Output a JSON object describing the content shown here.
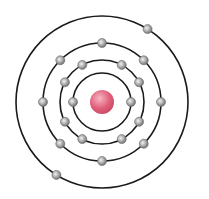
{
  "diagram": {
    "type": "bohr-atom-model",
    "element_electron_configuration": [
      2,
      8,
      8,
      2
    ],
    "center": [
      102,
      102
    ],
    "nucleus": {
      "radius": 12,
      "color": "#e0607a",
      "highlight": "#f7b6c4"
    },
    "electron": {
      "radius": 4.5,
      "color": "#9a9a9a",
      "highlight": "#f2f2f2",
      "stroke": "#6a6a6a"
    },
    "orbit_color": "#1a1a1a",
    "shells": [
      {
        "radius": 29,
        "electron_angles_deg": [
          180,
          0
        ]
      },
      {
        "radius": 42,
        "electron_angles_deg": [
          -118,
          -62,
          -28,
          28,
          62,
          118,
          152,
          208
        ]
      },
      {
        "radius": 59,
        "electron_angles_deg": [
          -90,
          -45,
          0,
          45,
          90,
          135,
          180,
          225
        ]
      },
      {
        "radius": 86,
        "electron_angles_deg": [
          -58,
          122
        ]
      }
    ]
  }
}
